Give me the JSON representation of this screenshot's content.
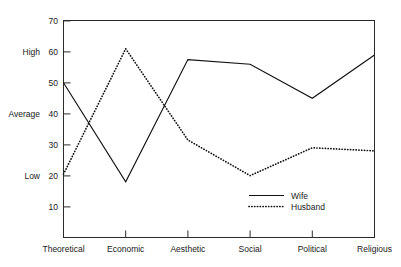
{
  "chart_data": {
    "type": "line",
    "title": "",
    "xlabel": "",
    "ylabel": "",
    "ylim": [
      0,
      70
    ],
    "yticks": [
      10,
      20,
      30,
      40,
      50,
      60,
      70
    ],
    "grid": false,
    "legend_position": "inside-bottom-right",
    "categories": [
      "Theoretical",
      "Economic",
      "Aesthetic",
      "Social",
      "Political",
      "Religious"
    ],
    "band_labels": [
      {
        "label": "High",
        "value": 60
      },
      {
        "label": "Average",
        "value": 40
      },
      {
        "label": "Low",
        "value": 20
      }
    ],
    "series": [
      {
        "name": "Wife",
        "style": "solid",
        "values": [
          50,
          18,
          57.5,
          56,
          45,
          59
        ]
      },
      {
        "name": "Husband",
        "style": "dotted",
        "values": [
          20.5,
          61,
          31.5,
          20,
          29,
          28
        ]
      }
    ]
  },
  "axis": {
    "tick_10": "10",
    "tick_20": "20",
    "tick_30": "30",
    "tick_40": "40",
    "tick_50": "50",
    "tick_60": "60",
    "tick_70": "70"
  },
  "bands": {
    "high": "High",
    "average": "Average",
    "low": "Low"
  },
  "categories": {
    "c0": "Theoretical",
    "c1": "Economic",
    "c2": "Aesthetic",
    "c3": "Social",
    "c4": "Political",
    "c5": "Religious"
  },
  "legend": {
    "wife": "Wife",
    "husband": "Husband"
  }
}
